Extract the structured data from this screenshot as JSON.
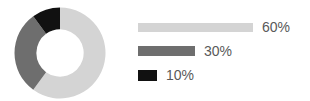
{
  "chart_data": {
    "type": "pie",
    "variant": "donut",
    "title": "",
    "subtitle": "",
    "xlabel": "",
    "ylabel": "",
    "grid": false,
    "legend_position": "right",
    "hole_ratio": 0.52,
    "start_angle_deg": 0,
    "direction": "clockwise",
    "categories": [
      "60%",
      "30%",
      "10%"
    ],
    "values": [
      60,
      30,
      10
    ],
    "labels": [
      "60%",
      "30%",
      "10%"
    ],
    "colors": [
      "#d4d4d4",
      "#6e6e6e",
      "#111111"
    ],
    "slices": [
      {
        "label": "60%",
        "value": 60,
        "color": "#d4d4d4",
        "start_deg": 0,
        "end_deg": 216
      },
      {
        "label": "30%",
        "value": 30,
        "color": "#6e6e6e",
        "start_deg": 216,
        "end_deg": 324
      },
      {
        "label": "10%",
        "value": 10,
        "color": "#111111",
        "start_deg": 324,
        "end_deg": 360
      }
    ]
  },
  "legend": {
    "items": [
      {
        "label": "60%",
        "value": 60,
        "color": "#d4d4d4",
        "bar_width_px": 115
      },
      {
        "label": "30%",
        "value": 30,
        "color": "#6e6e6e",
        "bar_width_px": 57
      },
      {
        "label": "10%",
        "value": 10,
        "color": "#111111",
        "bar_width_px": 19
      }
    ]
  },
  "style": {
    "background": "#ffffff",
    "text_color": "#595959"
  }
}
